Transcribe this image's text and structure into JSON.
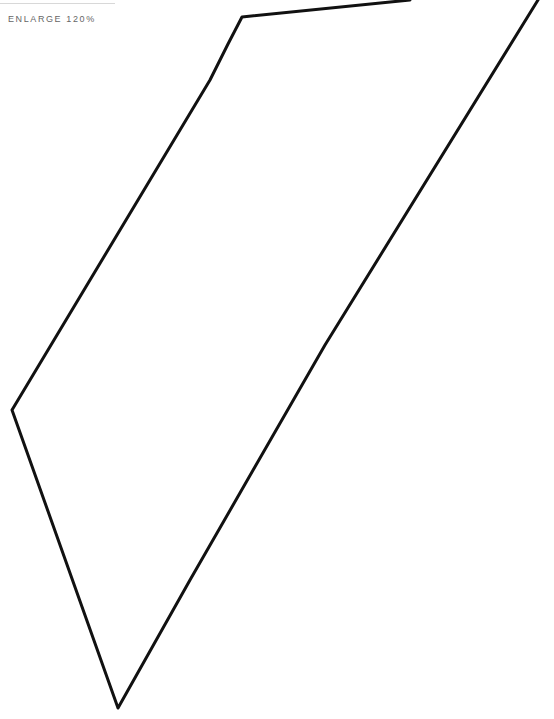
{
  "header": {
    "enlarge_label": "ENLARGE 120%"
  },
  "drawing": {
    "stroke_color": "#111111",
    "stroke_width": 3,
    "shape": "hand-drawn-outline-polygon",
    "points": [
      [
        410,
        0
      ],
      [
        242,
        17
      ],
      [
        210,
        80
      ],
      [
        12,
        410
      ],
      [
        118,
        708
      ],
      [
        325,
        345
      ],
      [
        538,
        0
      ]
    ]
  }
}
